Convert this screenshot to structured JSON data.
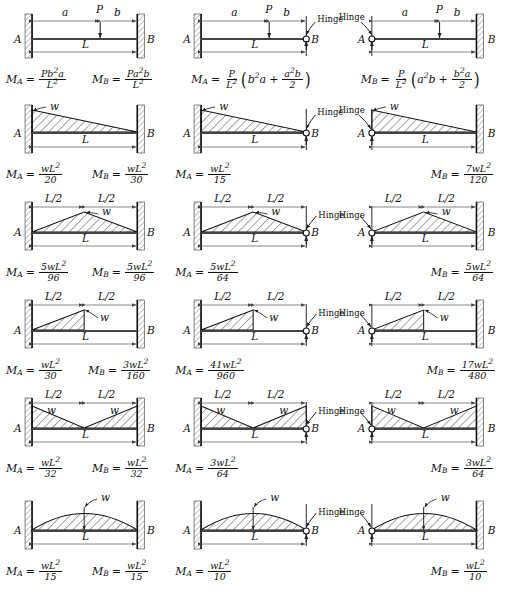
{
  "figure": {
    "symbols": {
      "node_a": "A",
      "node_b": "B",
      "span": "L",
      "half_span": "L/2",
      "dist_a": "a",
      "dist_b": "b",
      "point_load": "P",
      "dist_load": "w",
      "hinge": "Hinge",
      "moment_a": "M",
      "moment_b": "M",
      "sub_a": "A",
      "sub_b": "B",
      "equals": "="
    },
    "colors": {
      "ink": "#111111",
      "beam": "#3a3a3a",
      "hatch": "#222222",
      "wall_fill": "#9a9a9a",
      "dimension": "#555555"
    },
    "columns": [
      {
        "id": "col-fixed-fixed",
        "left_support": "fixed",
        "right_support": "fixed"
      },
      {
        "id": "col-fixed-hinge-b",
        "left_support": "fixed",
        "right_support": "hinge"
      },
      {
        "id": "col-hinge-a-fixed",
        "left_support": "hinge",
        "right_support": "fixed"
      }
    ],
    "rows": [
      {
        "id": "row-point-load",
        "load_type": "point",
        "cells": [
          {
            "id": "r1c1",
            "support": "fixed-fixed",
            "dimensions": [
              "a",
              "b",
              "L"
            ],
            "load_label": "P",
            "formulas": [
              {
                "name": "M_A",
                "lhs": "M",
                "sub": "A",
                "num": "Pb",
                "num_sup": "2",
                "num_tail": "a",
                "den": "L",
                "den_sup": "2",
                "text": "M_A = Pb²a / L²"
              },
              {
                "name": "M_B",
                "lhs": "M",
                "sub": "B",
                "num": "Pa",
                "num_sup": "2",
                "num_tail": "b",
                "den": "L",
                "den_sup": "2",
                "text": "M_B = Pa²b / L²"
              }
            ]
          },
          {
            "id": "r1c2",
            "support": "fixed-hinge",
            "dimensions": [
              "a",
              "b",
              "L"
            ],
            "load_label": "P",
            "hinge_label": "Hinge",
            "formulas": [
              {
                "name": "M_A",
                "text": "M_A = (P/L²)(b²a + a²b/2)",
                "lhs": "M",
                "sub": "A",
                "coef_num": "P",
                "coef_den": "L",
                "coef_den_sup": "2",
                "t1": "b",
                "t1_sup": "2",
                "t1_tail": "a",
                "plus": "+",
                "t2_num": "a",
                "t2_num_sup": "2",
                "t2_num_tail": "b",
                "t2_den": "2"
              }
            ]
          },
          {
            "id": "r1c3",
            "support": "hinge-fixed",
            "dimensions": [
              "a",
              "b",
              "L"
            ],
            "load_label": "P",
            "hinge_label": "Hinge",
            "formulas": [
              {
                "name": "M_B",
                "text": "M_B = (P/L²)(a²b + b²a/2)",
                "lhs": "M",
                "sub": "B",
                "coef_num": "P",
                "coef_den": "L",
                "coef_den_sup": "2",
                "t1": "a",
                "t1_sup": "2",
                "t1_tail": "b",
                "plus": "+",
                "t2_num": "b",
                "t2_num_sup": "2",
                "t2_num_tail": "a",
                "t2_den": "2"
              }
            ]
          }
        ]
      },
      {
        "id": "row-triangular-descending",
        "load_type": "triangle-left-peak",
        "cells": [
          {
            "id": "r2c1",
            "support": "fixed-fixed",
            "dimensions": [
              "L"
            ],
            "load_label": "w",
            "formulas": [
              {
                "name": "M_A",
                "lhs": "M",
                "sub": "A",
                "num": "wL",
                "num_sup": "2",
                "den": "20",
                "text": "M_A = wL²/20"
              },
              {
                "name": "M_B",
                "lhs": "M",
                "sub": "B",
                "num": "wL",
                "num_sup": "2",
                "den": "30",
                "text": "M_B = wL²/30"
              }
            ]
          },
          {
            "id": "r2c2",
            "support": "fixed-hinge",
            "dimensions": [
              "L"
            ],
            "load_label": "w",
            "hinge_label": "Hinge",
            "formulas": [
              {
                "name": "M_A",
                "lhs": "M",
                "sub": "A",
                "num": "wL",
                "num_sup": "2",
                "den": "15",
                "text": "M_A = wL²/15"
              }
            ]
          },
          {
            "id": "r2c3",
            "support": "hinge-fixed",
            "dimensions": [
              "L"
            ],
            "load_label": "w",
            "hinge_label": "Hinge",
            "formulas": [
              {
                "name": "M_B",
                "lhs": "M",
                "sub": "B",
                "num": "7wL",
                "num_sup": "2",
                "den": "120",
                "text": "M_B = 7wL²/120"
              }
            ]
          }
        ]
      },
      {
        "id": "row-triangular-center-peak",
        "load_type": "triangle-center-peak",
        "cells": [
          {
            "id": "r3c1",
            "support": "fixed-fixed",
            "dimensions": [
              "L/2",
              "L/2",
              "L"
            ],
            "load_label": "w",
            "formulas": [
              {
                "name": "M_A",
                "lhs": "M",
                "sub": "A",
                "num": "5wL",
                "num_sup": "2",
                "den": "96",
                "text": "M_A = 5wL²/96"
              },
              {
                "name": "M_B",
                "lhs": "M",
                "sub": "B",
                "num": "5wL",
                "num_sup": "2",
                "den": "96",
                "text": "M_B = 5wL²/96"
              }
            ]
          },
          {
            "id": "r3c2",
            "support": "fixed-hinge",
            "dimensions": [
              "L/2",
              "L/2",
              "L"
            ],
            "load_label": "w",
            "hinge_label": "Hinge",
            "formulas": [
              {
                "name": "M_A",
                "lhs": "M",
                "sub": "A",
                "num": "5wL",
                "num_sup": "2",
                "den": "64",
                "text": "M_A = 5wL²/64"
              }
            ]
          },
          {
            "id": "r3c3",
            "support": "hinge-fixed",
            "dimensions": [
              "L/2",
              "L/2",
              "L"
            ],
            "load_label": "w",
            "hinge_label": "Hinge",
            "formulas": [
              {
                "name": "M_B",
                "lhs": "M",
                "sub": "B",
                "num": "5wL",
                "num_sup": "2",
                "den": "64",
                "text": "M_B = 5wL²/64"
              }
            ]
          }
        ]
      },
      {
        "id": "row-half-triangle",
        "load_type": "half-span-triangle",
        "cells": [
          {
            "id": "r4c1",
            "support": "fixed-fixed",
            "dimensions": [
              "L/2",
              "L/2",
              "L"
            ],
            "load_label": "w",
            "formulas": [
              {
                "name": "M_A",
                "lhs": "M",
                "sub": "A",
                "num": "wL",
                "num_sup": "2",
                "den": "30",
                "text": "M_A = wL²/30"
              },
              {
                "name": "M_B",
                "lhs": "M",
                "sub": "B",
                "num": "3wL",
                "num_sup": "2",
                "den": "160",
                "text": "M_B = 3wL²/160"
              }
            ]
          },
          {
            "id": "r4c2",
            "support": "fixed-hinge",
            "dimensions": [
              "L/2",
              "L/2",
              "L"
            ],
            "load_label": "w",
            "hinge_label": "Hinge",
            "formulas": [
              {
                "name": "M_A",
                "lhs": "M",
                "sub": "A",
                "num": "41wL",
                "num_sup": "2",
                "den": "960",
                "text": "M_A = 41wL²/960"
              }
            ]
          },
          {
            "id": "r4c3",
            "support": "hinge-fixed",
            "dimensions": [
              "L/2",
              "L/2",
              "L"
            ],
            "load_label": "w",
            "hinge_label": "Hinge",
            "formulas": [
              {
                "name": "M_B",
                "lhs": "M",
                "sub": "B",
                "num": "17wL",
                "num_sup": "2",
                "den": "480",
                "text": "M_B = 17wL²/480"
              }
            ]
          }
        ]
      },
      {
        "id": "row-double-triangle",
        "load_type": "v-shaped-double-triangle",
        "cells": [
          {
            "id": "r5c1",
            "support": "fixed-fixed",
            "dimensions": [
              "L/2",
              "L/2",
              "L"
            ],
            "load_label": "w",
            "load_label_2": "w",
            "formulas": [
              {
                "name": "M_A",
                "lhs": "M",
                "sub": "A",
                "num": "wL",
                "num_sup": "2",
                "den": "32",
                "text": "M_A = wL²/32"
              },
              {
                "name": "M_B",
                "lhs": "M",
                "sub": "B",
                "num": "wL",
                "num_sup": "2",
                "den": "32",
                "text": "M_B = wL²/32"
              }
            ]
          },
          {
            "id": "r5c2",
            "support": "fixed-hinge",
            "dimensions": [
              "L/2",
              "L/2",
              "L"
            ],
            "load_label": "w",
            "load_label_2": "w",
            "hinge_label": "Hinge",
            "formulas": [
              {
                "name": "M_A",
                "lhs": "M",
                "sub": "A",
                "num": "3wL",
                "num_sup": "2",
                "den": "64",
                "text": "M_A = 3wL²/64"
              }
            ]
          },
          {
            "id": "r5c3",
            "support": "hinge-fixed",
            "dimensions": [
              "L/2",
              "L/2",
              "L"
            ],
            "load_label": "w",
            "load_label_2": "w",
            "hinge_label": "Hinge",
            "formulas": [
              {
                "name": "M_B",
                "lhs": "M",
                "sub": "B",
                "num": "3wL",
                "num_sup": "2",
                "den": "64",
                "text": "M_B = 3wL²/64"
              }
            ]
          }
        ]
      },
      {
        "id": "row-parabolic",
        "load_type": "parabolic",
        "cells": [
          {
            "id": "r6c1",
            "support": "fixed-fixed",
            "dimensions": [
              "L"
            ],
            "load_label": "w",
            "formulas": [
              {
                "name": "M_A",
                "lhs": "M",
                "sub": "A",
                "num": "wL",
                "num_sup": "2",
                "den": "15",
                "text": "M_A = wL²/15"
              },
              {
                "name": "M_B",
                "lhs": "M",
                "sub": "B",
                "num": "wL",
                "num_sup": "2",
                "den": "15",
                "text": "M_B = wL²/15"
              }
            ]
          },
          {
            "id": "r6c2",
            "support": "fixed-hinge",
            "dimensions": [
              "L"
            ],
            "load_label": "w",
            "hinge_label": "Hinge",
            "formulas": [
              {
                "name": "M_A",
                "lhs": "M",
                "sub": "A",
                "num": "wL",
                "num_sup": "2",
                "den": "10",
                "text": "M_A = wL²/10"
              }
            ]
          },
          {
            "id": "r6c3",
            "support": "hinge-fixed",
            "dimensions": [
              "L"
            ],
            "load_label": "w",
            "hinge_label": "Hinge",
            "formulas": [
              {
                "name": "M_B",
                "lhs": "M",
                "sub": "B",
                "num": "wL",
                "num_sup": "2",
                "den": "10",
                "text": "M_B = wL²/10"
              }
            ]
          }
        ]
      }
    ]
  }
}
